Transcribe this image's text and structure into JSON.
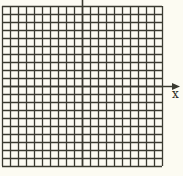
{
  "diagram": {
    "type": "coordinate-grid",
    "grid": {
      "columns": 20,
      "rows": 20,
      "left": 2,
      "top": 6,
      "cell": 8,
      "line_color": "#3a3a30",
      "background": "#fcfbf2"
    },
    "x_axis": {
      "label": "x",
      "row_index": 10,
      "arrow": true
    },
    "y_axis": {
      "label": "",
      "column_index": 10,
      "extends_to_top": true
    }
  }
}
